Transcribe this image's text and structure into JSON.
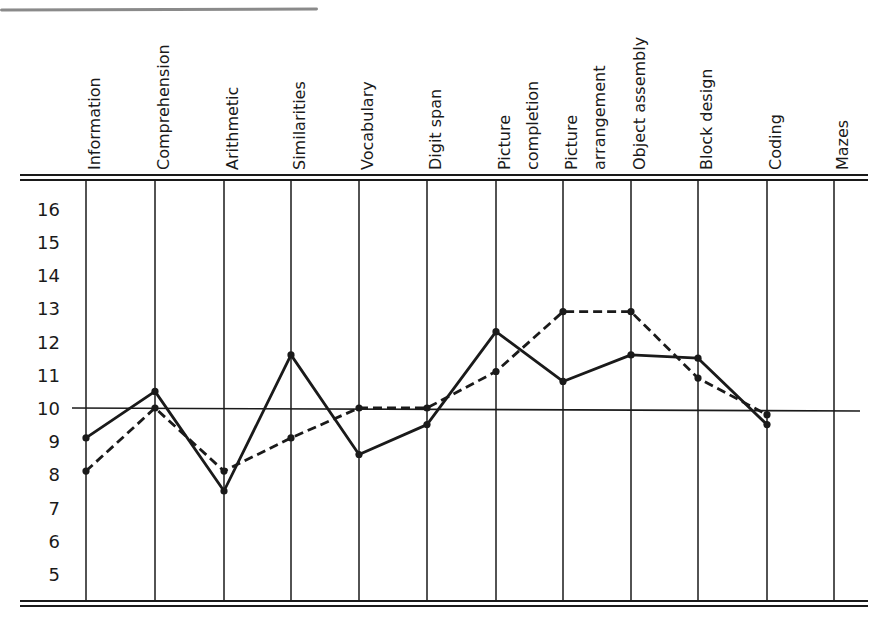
{
  "chart_data": {
    "type": "line",
    "title": "",
    "xlabel": "",
    "ylabel": "",
    "categories": [
      "Information",
      "Comprehension",
      "Arithmetic",
      "Similarities",
      "Vocabulary",
      "Digit span",
      "Picture completion",
      "Picture arrangement",
      "Object assembly",
      "Block design",
      "Coding",
      "Mazes"
    ],
    "category_lines": [
      [
        "Information"
      ],
      [
        "Comprehension"
      ],
      [
        "Arithmetic"
      ],
      [
        "Similarities"
      ],
      [
        "Vocabulary"
      ],
      [
        "Digit span"
      ],
      [
        "Picture",
        "completion"
      ],
      [
        "Picture",
        "arrangement"
      ],
      [
        "Object assembly"
      ],
      [
        "Block design"
      ],
      [
        "Coding"
      ],
      [
        "Mazes"
      ]
    ],
    "yticks": [
      16,
      15,
      14,
      13,
      12,
      11,
      10,
      9,
      8,
      7,
      6,
      5
    ],
    "ylim": [
      4,
      16.7
    ],
    "reference_line": 10,
    "grid": "vertical lines per category",
    "legend": null,
    "series": [
      {
        "name": "solid",
        "style": "solid",
        "values": [
          9.1,
          10.5,
          7.5,
          11.6,
          8.6,
          9.5,
          12.3,
          10.8,
          11.6,
          11.5,
          9.5,
          null
        ]
      },
      {
        "name": "dashed",
        "style": "dashed",
        "values": [
          8.1,
          10.0,
          8.1,
          9.1,
          10.0,
          10.0,
          11.1,
          12.9,
          12.9,
          10.9,
          9.8,
          null
        ]
      }
    ]
  },
  "colors": {
    "ink": "#1a1a1a",
    "background": "#ffffff"
  }
}
